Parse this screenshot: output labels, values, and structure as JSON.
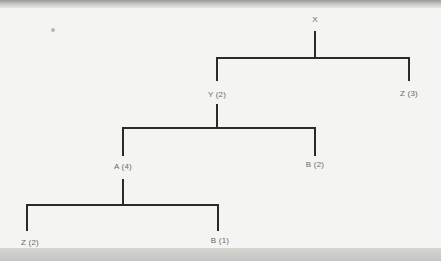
{
  "diagram": {
    "type": "tree",
    "line_color": "#2a2a2a",
    "text_color": "#6a6a6a",
    "nodes": [
      {
        "id": "root",
        "label": "X",
        "x": 315,
        "y": 20
      },
      {
        "id": "y",
        "label": "Y (2)",
        "x": 217,
        "y": 95,
        "parent": "root"
      },
      {
        "id": "z3",
        "label": "Z (3)",
        "x": 409,
        "y": 93,
        "parent": "root"
      },
      {
        "id": "a",
        "label": "A (4)",
        "x": 123,
        "y": 167,
        "parent": "y"
      },
      {
        "id": "b2",
        "label": "B (2)",
        "x": 315,
        "y": 165,
        "parent": "y"
      },
      {
        "id": "z2",
        "label": "Z (2)",
        "x": 27,
        "y": 244,
        "parent": "a"
      },
      {
        "id": "b1",
        "label": "B (1)",
        "x": 218,
        "y": 242,
        "parent": "a"
      }
    ]
  }
}
